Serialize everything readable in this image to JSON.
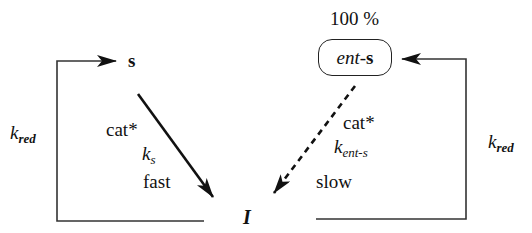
{
  "diagram": {
    "nodes": {
      "s": {
        "label": "s"
      },
      "ent_s": {
        "prefix": "ent",
        "dash": "-",
        "suffix": "s",
        "percentage": "100 %"
      },
      "I": {
        "label": "I"
      }
    },
    "edges": {
      "s_to_I": {
        "style": "solid",
        "catalyst": "cat*",
        "rate_k": "k",
        "rate_sub": "s",
        "speed": "fast"
      },
      "ent_s_to_I": {
        "style": "dashed",
        "catalyst": "cat*",
        "rate_k": "k",
        "rate_sub": "ent-s",
        "speed": "slow"
      },
      "I_to_s_reduction": {
        "rate_k": "k",
        "rate_sub": "red"
      },
      "I_to_ent_s_reduction": {
        "rate_k": "k",
        "rate_sub": "red"
      }
    },
    "colors": {
      "line": "#111111",
      "background": "#ffffff"
    }
  }
}
